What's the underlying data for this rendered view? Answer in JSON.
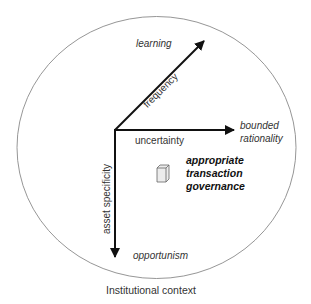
{
  "diagram": {
    "container_label": "Institutional context",
    "axes": [
      {
        "name": "frequency",
        "label": "frequency",
        "endpoint_label": "learning",
        "direction": "diagonal-up-right"
      },
      {
        "name": "uncertainty",
        "label": "uncertainty",
        "endpoint_label_line1": "bounded",
        "endpoint_label_line2": "rationality",
        "direction": "right"
      },
      {
        "name": "asset-specificity",
        "label": "asset specificity",
        "endpoint_label": "opportunism",
        "direction": "down"
      }
    ],
    "center_object": {
      "icon": "cube-icon",
      "label_line1": "appropriate",
      "label_line2": "transaction",
      "label_line3": "governance"
    },
    "colors": {
      "ellipse_stroke": "#8a8a8a",
      "arrow": "#111111",
      "text": "#333333",
      "box_fill": "#ececec"
    }
  }
}
